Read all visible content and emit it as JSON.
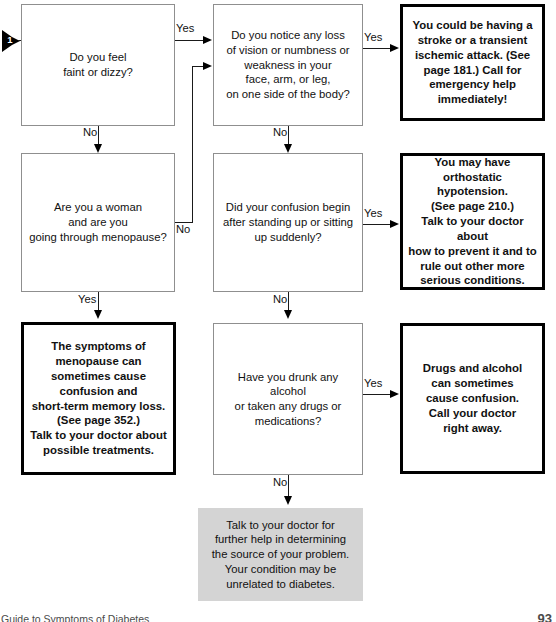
{
  "document": {
    "footer_title": "Guide to Symptoms of Diabetes",
    "page_number": "93"
  },
  "entry": {
    "marker_label": "1",
    "marker_icon": "pennant-arrow-icon"
  },
  "colors": {
    "question_border": "#8f8f8f",
    "answer_border": "#000000",
    "terminal_fill": "#d4d4d4",
    "line": "#1a1a1a",
    "text": "#111111"
  },
  "nodes": {
    "q1": {
      "id": "q1",
      "kind": "question",
      "text": "Do you feel\nfaint or dizzy?"
    },
    "q2": {
      "id": "q2",
      "kind": "question",
      "text": "Do you notice any loss\nof vision or numbness or\nweakness in your\nface, arm, or leg,\non one side of the body?"
    },
    "a1": {
      "id": "a1",
      "kind": "answer",
      "text": "You could be having a\nstroke or a transient\nischemic attack. (See\npage 181.) Call for\nemergency help\nimmediately!"
    },
    "q3": {
      "id": "q3",
      "kind": "question",
      "text": "Are you a woman\nand are you\ngoing through menopause?"
    },
    "q4": {
      "id": "q4",
      "kind": "question",
      "text": "Did your confusion begin\nafter standing up or sitting\nup suddenly?"
    },
    "a2": {
      "id": "a2",
      "kind": "answer",
      "text": "You may have\northostatic hypotension.\n(See page 210.)\nTalk to your doctor about\nhow to prevent it and to\nrule out other more\nserious conditions."
    },
    "a3": {
      "id": "a3",
      "kind": "answer",
      "text": "The symptoms of\nmenopause can\nsometimes cause\nconfusion and\nshort-term memory loss.\n(See page 352.)\nTalk to your doctor about\npossible treatments."
    },
    "q5": {
      "id": "q5",
      "kind": "question",
      "text": "Have you drunk any alcohol\nor taken any drugs or\nmedications?"
    },
    "a4": {
      "id": "a4",
      "kind": "answer",
      "text": "Drugs and alcohol\ncan sometimes\ncause confusion.\nCall your doctor\nright away."
    },
    "t1": {
      "id": "t1",
      "kind": "terminal",
      "text": "Talk to your doctor for\nfurther help in determining\nthe source of your problem.\nYour condition may be\nunrelated to diabetes."
    }
  },
  "edges": {
    "q1_yes": "Yes",
    "q1_no": "No",
    "q2_yes": "Yes",
    "q2_no": "No",
    "q3_yes": "Yes",
    "q3_no": "No",
    "q4_yes": "Yes",
    "q4_no": "No",
    "q5_yes": "Yes",
    "q5_no": "No"
  }
}
